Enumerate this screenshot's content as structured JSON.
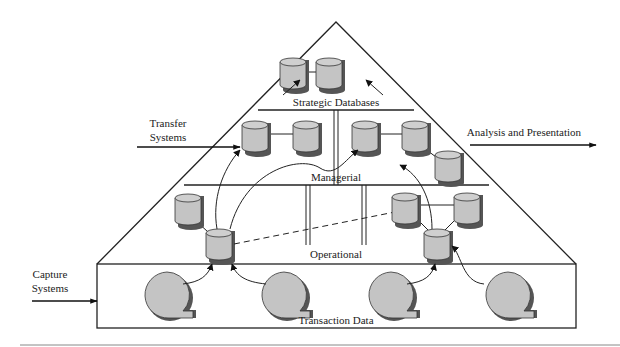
{
  "diagram": {
    "type": "data-warehouse-pyramid",
    "colors": {
      "stroke": "#222222",
      "cylinder_fill": "#c4c4c4",
      "cylinder_shadow": "#555555",
      "background": "#ffffff"
    },
    "tiers": [
      {
        "id": "strategic",
        "label": "Strategic Databases"
      },
      {
        "id": "managerial",
        "label": "Managerial"
      },
      {
        "id": "operational",
        "label": "Operational"
      },
      {
        "id": "transaction",
        "label": "Transaction Data"
      }
    ],
    "external_flows": [
      {
        "id": "transfer",
        "label_line1": "Transfer",
        "label_line2": "Systems",
        "direction": "in"
      },
      {
        "id": "analysis",
        "label": "Analysis and Presentation",
        "direction": "out"
      },
      {
        "id": "capture",
        "label_line1": "Capture",
        "label_line2": "Systems",
        "direction": "in"
      }
    ],
    "nodes": {
      "strategic_databases": 2,
      "managerial_databases": 5,
      "operational_databases": 6,
      "transaction_sources": 4
    }
  }
}
